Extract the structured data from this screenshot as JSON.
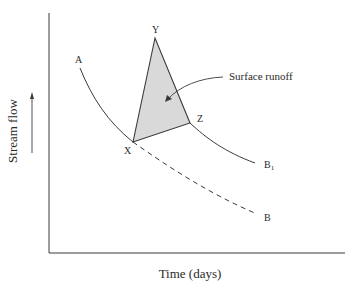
{
  "figure": {
    "type": "hydrograph",
    "axes": {
      "x_label": "Time (days)",
      "y_label": "Stream flow"
    },
    "curves": [
      {
        "id": "A-X",
        "label": "A",
        "style": "solid",
        "description": "recession curve from A down to X"
      },
      {
        "id": "X-B",
        "label": "B",
        "style": "dashed",
        "description": "projected recession without runoff"
      },
      {
        "id": "Z-B1",
        "label": "B₁",
        "style": "solid",
        "description": "recession after runoff event"
      }
    ],
    "points": {
      "X": "X",
      "Y": "Y",
      "Z": "Z",
      "A": "A",
      "B": "B",
      "B1_main": "B",
      "B1_sub": "1"
    },
    "shaded_region": {
      "label": "Surface runoff",
      "vertices": [
        "X",
        "Y",
        "Z"
      ],
      "fill": "#d9d9d9"
    },
    "colors": {
      "line": "#3a3a3a",
      "fill": "#d9d9d9",
      "background": "#ffffff"
    }
  }
}
